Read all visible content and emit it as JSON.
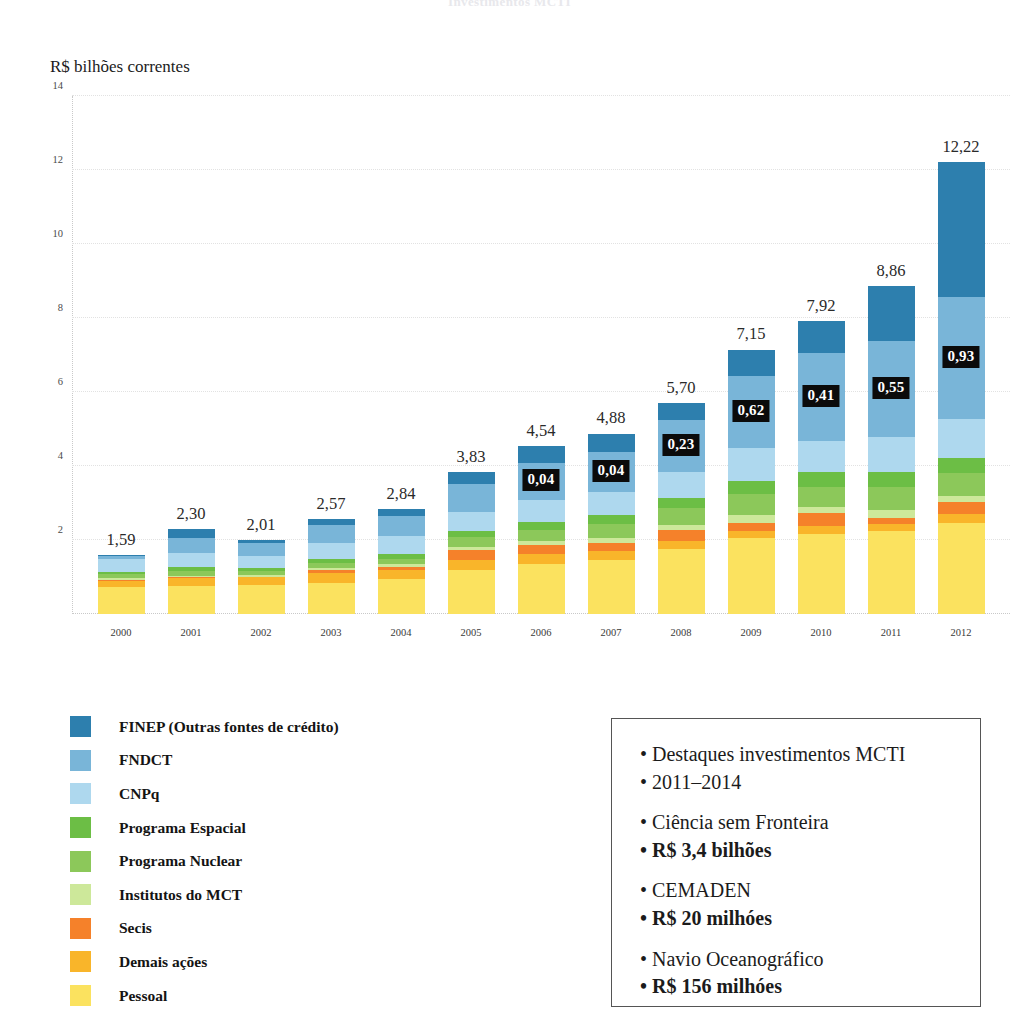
{
  "page": {
    "title": "Investimentos MCTI"
  },
  "chart_data": {
    "type": "bar",
    "subtype": "stacked-bar",
    "title": "Investimentos MCTI",
    "axis_caption": "R$ bilhões correntes",
    "xlabel": "",
    "ylabel": "R$ bilhões correntes",
    "ylim": [
      0,
      14
    ],
    "yticks": [
      2,
      4,
      6,
      8,
      10,
      12,
      14
    ],
    "ytick_labels": [
      "2",
      "4",
      "6",
      "8",
      "10",
      "12",
      "14"
    ],
    "grid": true,
    "legend_position": "below-left",
    "categories": [
      "2000",
      "2001",
      "2002",
      "2003",
      "2004",
      "2005",
      "2006",
      "2007",
      "2008",
      "2009",
      "2010",
      "2011",
      "2012"
    ],
    "totals": [
      1.59,
      2.3,
      2.01,
      2.57,
      2.84,
      3.83,
      4.54,
      4.88,
      5.7,
      7.15,
      7.92,
      8.86,
      12.22
    ],
    "total_labels": [
      "1,59",
      "2,30",
      "2,01",
      "2,57",
      "2,84",
      "3,83",
      "4,54",
      "4,88",
      "5,70",
      "7,15",
      "7,92",
      "8,86",
      "12,22"
    ],
    "series": [
      {
        "name": "Pessoal",
        "color": "#fbe25f",
        "values": [
          0.72,
          0.75,
          0.78,
          0.85,
          0.95,
          1.2,
          1.35,
          1.45,
          1.75,
          2.05,
          2.15,
          2.25,
          2.45
        ]
      },
      {
        "name": "Demais ações",
        "color": "#f9b52a",
        "values": [
          0.18,
          0.22,
          0.21,
          0.25,
          0.24,
          0.26,
          0.26,
          0.26,
          0.22,
          0.2,
          0.23,
          0.18,
          0.25
        ]
      },
      {
        "name": "Secis",
        "color": "#f5812a",
        "values": [
          0.02,
          0.02,
          0.02,
          0.1,
          0.09,
          0.26,
          0.25,
          0.22,
          0.3,
          0.22,
          0.34,
          0.16,
          0.32
        ]
      },
      {
        "name": "Institutos do MCT",
        "color": "#cde89a",
        "values": [
          0.06,
          0.05,
          0.04,
          0.05,
          0.06,
          0.09,
          0.11,
          0.13,
          0.14,
          0.21,
          0.16,
          0.22,
          0.18
        ]
      },
      {
        "name": "Programa Nuclear",
        "color": "#8cc85a",
        "values": [
          0.1,
          0.12,
          0.11,
          0.13,
          0.15,
          0.26,
          0.31,
          0.37,
          0.45,
          0.57,
          0.56,
          0.62,
          0.6
        ]
      },
      {
        "name": "Programa Espacial",
        "color": "#6cbe45",
        "values": [
          0.07,
          0.1,
          0.09,
          0.11,
          0.13,
          0.18,
          0.22,
          0.26,
          0.29,
          0.35,
          0.4,
          0.4,
          0.42
        ]
      },
      {
        "name": "CNPq",
        "color": "#aed8ee",
        "values": [
          0.33,
          0.39,
          0.33,
          0.44,
          0.48,
          0.5,
          0.59,
          0.61,
          0.7,
          0.9,
          0.85,
          0.95,
          1.05
        ]
      },
      {
        "name": "FNDCT",
        "color": "#79b5d8",
        "values": [
          0.08,
          0.41,
          0.33,
          0.49,
          0.56,
          0.76,
          1.0,
          1.07,
          1.4,
          1.93,
          2.37,
          2.61,
          3.3
        ]
      },
      {
        "name": "FINEP (Outras fontes de crédito)",
        "color": "#2d7fae",
        "values": [
          0.03,
          0.24,
          0.1,
          0.15,
          0.18,
          0.32,
          0.45,
          0.51,
          0.45,
          0.72,
          0.86,
          1.47,
          3.65
        ]
      }
    ],
    "inbar_annotations": [
      {
        "category": "2006",
        "value": 0.04,
        "label": "0,04"
      },
      {
        "category": "2007",
        "value": 0.04,
        "label": "0,04"
      },
      {
        "category": "2008",
        "value": 0.23,
        "label": "0,23"
      },
      {
        "category": "2009",
        "value": 0.62,
        "label": "0,62"
      },
      {
        "category": "2010",
        "value": 0.41,
        "label": "0,41"
      },
      {
        "category": "2011",
        "value": 0.55,
        "label": "0,55"
      },
      {
        "category": "2012",
        "value": 0.93,
        "label": "0,93"
      }
    ]
  },
  "legend": {
    "items": [
      {
        "label": "FINEP (Outras fontes de crédito)",
        "color": "#2d7fae"
      },
      {
        "label": "FNDCT",
        "color": "#79b5d8"
      },
      {
        "label": "CNPq",
        "color": "#aed8ee"
      },
      {
        "label": "Programa Espacial",
        "color": "#6cbe45"
      },
      {
        "label": "Programa Nuclear",
        "color": "#8cc85a"
      },
      {
        "label": "Institutos do MCT",
        "color": "#cde89a"
      },
      {
        "label": "Secis",
        "color": "#f5812a"
      },
      {
        "label": "Demais ações",
        "color": "#f9b52a"
      },
      {
        "label": "Pessoal",
        "color": "#fbe25f"
      }
    ]
  },
  "infobox": {
    "lines": [
      {
        "text": "• Destaques investimentos MCTI",
        "bold": false,
        "gap_after": false
      },
      {
        "text": "• 2011–2014",
        "bold": false,
        "gap_after": true
      },
      {
        "text": "• Ciência sem Fronteira",
        "bold": false,
        "gap_after": false
      },
      {
        "text": "• R$ 3,4 bilhões",
        "bold": true,
        "gap_after": true
      },
      {
        "text": "• CEMADEN",
        "bold": false,
        "gap_after": false
      },
      {
        "text": "• R$ 20 milhóes",
        "bold": true,
        "gap_after": true
      },
      {
        "text": "• Navio Oceanográfico",
        "bold": false,
        "gap_after": false
      },
      {
        "text": "• R$ 156 milhóes",
        "bold": true,
        "gap_after": false
      }
    ]
  }
}
